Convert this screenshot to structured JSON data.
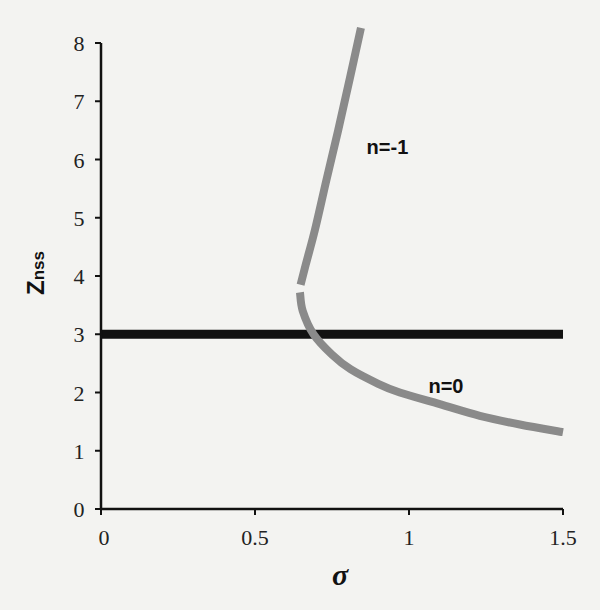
{
  "chart_data": {
    "type": "line",
    "title": "",
    "xlabel": "σ",
    "ylabel": "Znss",
    "ylabel_main": "Z",
    "ylabel_sub": "nss",
    "xlim": [
      0,
      1.5
    ],
    "ylim": [
      0,
      8
    ],
    "x_ticks": [
      0,
      0.5,
      1,
      1.5
    ],
    "x_tick_labels": [
      "0",
      "0.5",
      "1",
      "1.5"
    ],
    "y_ticks": [
      0,
      1,
      2,
      3,
      4,
      5,
      6,
      7,
      8
    ],
    "y_tick_labels": [
      "0",
      "1",
      "2",
      "3",
      "4",
      "5",
      "6",
      "7",
      "8"
    ],
    "grid": false,
    "legend": "none (inline labels)",
    "series": [
      {
        "name": "n=-1",
        "color": "#8a8a8a",
        "label_pos": {
          "x": 0.93,
          "y": 6.1
        },
        "points": [
          [
            0.844,
            8.26
          ],
          [
            0.807,
            7.37
          ],
          [
            0.77,
            6.5
          ],
          [
            0.732,
            5.65
          ],
          [
            0.695,
            4.8
          ],
          [
            0.665,
            4.2
          ],
          [
            0.648,
            3.85
          ]
        ]
      },
      {
        "name": "n=0",
        "color": "#8a8a8a",
        "label_pos": {
          "x": 1.12,
          "y": 2.0
        },
        "points": [
          [
            0.646,
            3.72
          ],
          [
            0.655,
            3.4
          ],
          [
            0.69,
            3.0
          ],
          [
            0.75,
            2.65
          ],
          [
            0.81,
            2.4
          ],
          [
            0.9,
            2.15
          ],
          [
            0.97,
            2.0
          ],
          [
            1.1,
            1.8
          ],
          [
            1.23,
            1.6
          ],
          [
            1.36,
            1.45
          ],
          [
            1.5,
            1.32
          ]
        ]
      },
      {
        "name": "threshold",
        "color": "#111111",
        "points": [
          [
            0,
            3
          ],
          [
            1.5,
            3
          ]
        ]
      }
    ]
  }
}
